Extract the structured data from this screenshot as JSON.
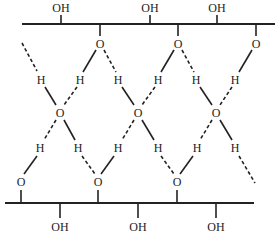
{
  "diagram": {
    "type": "hydrogen-bonding-network",
    "top_chain": {
      "hydroxyl_labels": [
        "OH",
        "OH",
        "OH"
      ],
      "oxygen_labels": [
        "O",
        "O",
        "O"
      ]
    },
    "middle_layer": {
      "upper_hydrogen_labels": [
        "H",
        "H",
        "H",
        "H",
        "H",
        "H"
      ],
      "oxygen_labels": [
        "O",
        "O",
        "O"
      ],
      "lower_hydrogen_labels": [
        "H",
        "H",
        "H",
        "H",
        "H",
        "H"
      ]
    },
    "bottom_chain": {
      "oxygen_labels": [
        "O",
        "O",
        "O"
      ],
      "hydroxyl_labels": [
        "OH",
        "OH",
        "OH"
      ]
    },
    "legend": {
      "solid_line": "covalent O–H bond",
      "dashed_line": "hydrogen bond"
    },
    "colors": {
      "ink": "#222222",
      "background": "#ffffff"
    }
  }
}
